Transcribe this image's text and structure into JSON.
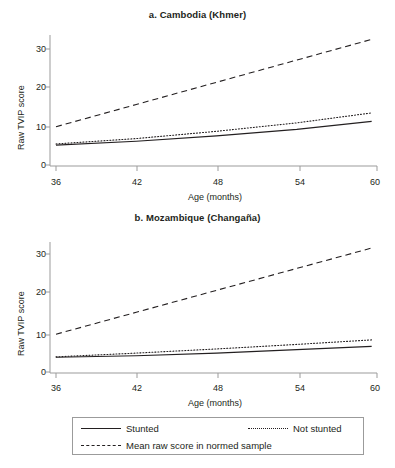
{
  "figure": {
    "background": "#ffffff",
    "line_color": "#231f20",
    "axis_color": "#9b9b9b"
  },
  "panels": [
    {
      "id": "a",
      "title": "a. Cambodia (Khmer)",
      "xlabel": "Age (months)",
      "ylabel": "Raw TVIP score",
      "xticks": [
        "36",
        "42",
        "48",
        "54",
        "60"
      ],
      "yticks": [
        "0",
        "10",
        "20",
        "30"
      ]
    },
    {
      "id": "b",
      "title": "b. Mozambique (Changaña)",
      "xlabel": "Age (months)",
      "ylabel": "Raw TVIP score",
      "xticks": [
        "36",
        "42",
        "48",
        "54",
        "60"
      ],
      "yticks": [
        "0",
        "10",
        "20",
        "30"
      ]
    }
  ],
  "legend": {
    "items": [
      {
        "label": "Stunted",
        "style": "solid"
      },
      {
        "label": "Not stunted",
        "style": "dotted"
      },
      {
        "label": "Mean raw score in normed sample",
        "style": "dashed"
      }
    ]
  },
  "chart_data": [
    {
      "type": "line",
      "title": "a. Cambodia (Khmer)",
      "xlabel": "Age (months)",
      "ylabel": "Raw TVIP score",
      "xlim": [
        36,
        60
      ],
      "ylim": [
        0,
        34
      ],
      "xticks": [
        36,
        42,
        48,
        54,
        60
      ],
      "yticks": [
        0,
        10,
        20,
        30
      ],
      "grid": false,
      "legend_position": "below-figure",
      "x": [
        36,
        42,
        48,
        54,
        59.6
      ],
      "series": [
        {
          "name": "Stunted",
          "style": "solid",
          "values": [
            5.2,
            6.2,
            7.6,
            9.3,
            11.4
          ]
        },
        {
          "name": "Not stunted",
          "style": "dotted",
          "values": [
            5.5,
            6.9,
            8.8,
            11.0,
            13.6
          ]
        },
        {
          "name": "Mean raw score in normed sample",
          "style": "dashed",
          "values": [
            10.0,
            15.8,
            21.6,
            27.4,
            32.8
          ]
        }
      ]
    },
    {
      "type": "line",
      "title": "b. Mozambique (Changaña)",
      "xlabel": "Age (months)",
      "ylabel": "Raw TVIP score",
      "xlim": [
        36,
        60
      ],
      "ylim": [
        0,
        34
      ],
      "xticks": [
        36,
        42,
        48,
        54,
        60
      ],
      "yticks": [
        0,
        10,
        20,
        30
      ],
      "grid": false,
      "legend_position": "below-figure",
      "x": [
        36,
        42,
        48,
        54,
        59.6
      ],
      "series": [
        {
          "name": "Stunted",
          "style": "solid",
          "values": [
            3.9,
            4.3,
            5.0,
            5.9,
            6.8
          ]
        },
        {
          "name": "Not stunted",
          "style": "dotted",
          "values": [
            4.0,
            5.0,
            6.1,
            7.3,
            8.5
          ]
        },
        {
          "name": "Mean raw score in normed sample",
          "style": "dashed",
          "values": [
            10.0,
            15.8,
            21.6,
            27.4,
            32.8
          ]
        }
      ]
    }
  ]
}
